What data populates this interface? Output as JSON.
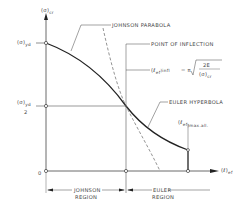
{
  "diagram": {
    "y_axis_label": "(σ)",
    "y_axis_label_sub": "cr",
    "x_axis_label": "(ℓ)",
    "x_axis_label_sub": "ef",
    "y_tick_top": "(σ)",
    "y_tick_top_sub": "yd",
    "y_tick_mid": "(σ)",
    "y_tick_mid_sub": "yd",
    "y_tick_mid_denominator": "2",
    "origin_label": "0",
    "annotations": {
      "johnson_parabola": "JOHNSON PARABOLA",
      "point_of_inflection": "POINT OF INFLECTION",
      "inflection_formula_lhs": "(ℓ",
      "inflection_formula_lhs_sub": "ef",
      "inflection_formula_lhs_sub2": ")infl",
      "inflection_formula_eq": "= π",
      "inflection_formula_num": "2E",
      "inflection_formula_den": "(σ)",
      "inflection_formula_den_sub": "cr",
      "euler_hyperbola": "EULER HYPERBOLA",
      "max_allowable": "(ℓ",
      "max_allowable_sub": "ef",
      "max_allowable_sub2": ")max.all."
    },
    "regions": {
      "johnson_line1": "JOHNSON",
      "johnson_line2": "REGION",
      "euler_line1": "EULER",
      "euler_line2": "REGION"
    },
    "colors": {
      "line": "#333333",
      "curve": "#222222",
      "text": "#444444",
      "dashed": "#666666"
    }
  }
}
